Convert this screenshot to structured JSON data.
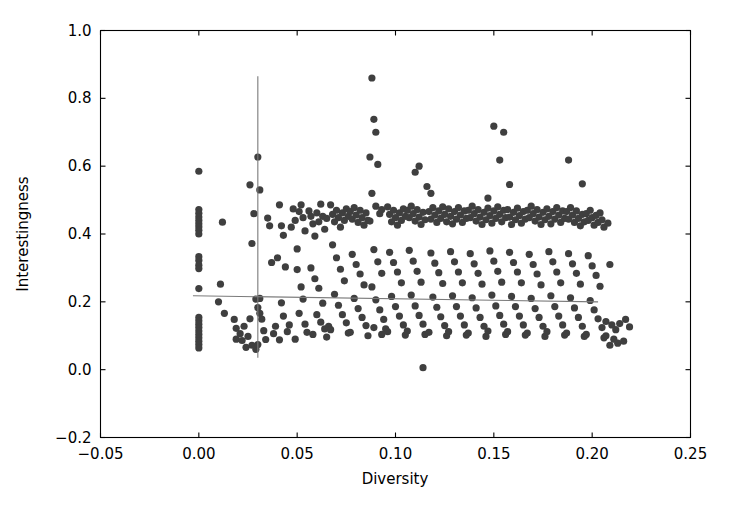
{
  "chart_data": {
    "type": "scatter",
    "title": "",
    "xlabel": "Diversity",
    "ylabel": "Interestingness",
    "xlim": [
      -0.05,
      0.25
    ],
    "ylim": [
      -0.2,
      1.0
    ],
    "xticks": [
      -0.05,
      0.0,
      0.05,
      0.1,
      0.15,
      0.2,
      0.25
    ],
    "xtick_labels": [
      "−0.05",
      "0.00",
      "0.05",
      "0.10",
      "0.15",
      "0.20",
      "0.25"
    ],
    "yticks": [
      -0.2,
      0.0,
      0.2,
      0.4,
      0.6,
      0.8,
      1.0
    ],
    "ytick_labels": [
      "−0.2",
      "0.0",
      "0.2",
      "0.4",
      "0.6",
      "0.8",
      "1.0"
    ],
    "grid": false,
    "legend": null,
    "marker": {
      "shape": "circle",
      "size": 5.2,
      "color": "#3f3f3f"
    },
    "annotations": [
      {
        "name": "vertical-reference-line",
        "type": "vline",
        "x": 0.03,
        "y_start": 0.035,
        "y_end": 0.865,
        "color": "#7a7a7a"
      },
      {
        "name": "regression-line",
        "type": "line",
        "x_start": -0.003,
        "x_end": 0.203,
        "y_start": 0.218,
        "y_end": 0.2,
        "color": "#7a7a7a"
      }
    ],
    "points": [
      [
        0.0,
        0.585
      ],
      [
        0.0,
        0.472
      ],
      [
        0.0,
        0.461
      ],
      [
        0.0,
        0.45
      ],
      [
        0.0,
        0.44
      ],
      [
        0.0,
        0.43
      ],
      [
        0.0,
        0.421
      ],
      [
        0.0,
        0.411
      ],
      [
        0.0,
        0.4
      ],
      [
        0.0,
        0.333
      ],
      [
        0.0,
        0.322
      ],
      [
        0.0,
        0.308
      ],
      [
        0.0,
        0.298
      ],
      [
        0.0,
        0.239
      ],
      [
        0.0,
        0.154
      ],
      [
        0.0,
        0.144
      ],
      [
        0.0,
        0.134
      ],
      [
        0.0,
        0.124
      ],
      [
        0.0,
        0.114
      ],
      [
        0.0,
        0.104
      ],
      [
        0.0,
        0.094
      ],
      [
        0.0,
        0.084
      ],
      [
        0.0,
        0.074
      ],
      [
        0.0,
        0.064
      ],
      [
        0.012,
        0.435
      ],
      [
        0.011,
        0.252
      ],
      [
        0.01,
        0.2
      ],
      [
        0.013,
        0.166
      ],
      [
        0.018,
        0.148
      ],
      [
        0.019,
        0.122
      ],
      [
        0.021,
        0.106
      ],
      [
        0.019,
        0.09
      ],
      [
        0.022,
        0.086
      ],
      [
        0.023,
        0.128
      ],
      [
        0.025,
        0.098
      ],
      [
        0.026,
        0.15
      ],
      [
        0.024,
        0.066
      ],
      [
        0.027,
        0.072
      ],
      [
        0.03,
        0.627
      ],
      [
        0.026,
        0.545
      ],
      [
        0.031,
        0.53
      ],
      [
        0.028,
        0.46
      ],
      [
        0.027,
        0.372
      ],
      [
        0.029,
        0.208
      ],
      [
        0.031,
        0.21
      ],
      [
        0.03,
        0.183
      ],
      [
        0.031,
        0.166
      ],
      [
        0.032,
        0.149
      ],
      [
        0.033,
        0.115
      ],
      [
        0.034,
        0.089
      ],
      [
        0.029,
        0.06
      ],
      [
        0.03,
        0.074
      ],
      [
        0.035,
        0.447
      ],
      [
        0.036,
        0.424
      ],
      [
        0.037,
        0.316
      ],
      [
        0.039,
        0.128
      ],
      [
        0.038,
        0.106
      ],
      [
        0.041,
        0.486
      ],
      [
        0.042,
        0.424
      ],
      [
        0.043,
        0.396
      ],
      [
        0.04,
        0.33
      ],
      [
        0.044,
        0.303
      ],
      [
        0.042,
        0.197
      ],
      [
        0.043,
        0.158
      ],
      [
        0.045,
        0.112
      ],
      [
        0.041,
        0.088
      ],
      [
        0.046,
        0.132
      ],
      [
        0.048,
        0.474
      ],
      [
        0.049,
        0.44
      ],
      [
        0.047,
        0.42
      ],
      [
        0.05,
        0.356
      ],
      [
        0.052,
        0.486
      ],
      [
        0.051,
        0.466
      ],
      [
        0.053,
        0.448
      ],
      [
        0.054,
        0.409
      ],
      [
        0.05,
        0.295
      ],
      [
        0.052,
        0.244
      ],
      [
        0.053,
        0.208
      ],
      [
        0.051,
        0.166
      ],
      [
        0.054,
        0.134
      ],
      [
        0.055,
        0.11
      ],
      [
        0.049,
        0.09
      ],
      [
        0.056,
        0.468
      ],
      [
        0.057,
        0.452
      ],
      [
        0.058,
        0.43
      ],
      [
        0.059,
        0.394
      ],
      [
        0.06,
        0.462
      ],
      [
        0.061,
        0.436
      ],
      [
        0.062,
        0.488
      ],
      [
        0.063,
        0.452
      ],
      [
        0.064,
        0.414
      ],
      [
        0.065,
        0.446
      ],
      [
        0.057,
        0.3
      ],
      [
        0.059,
        0.268
      ],
      [
        0.061,
        0.24
      ],
      [
        0.063,
        0.196
      ],
      [
        0.06,
        0.162
      ],
      [
        0.062,
        0.14
      ],
      [
        0.064,
        0.12
      ],
      [
        0.058,
        0.104
      ],
      [
        0.065,
        0.096
      ],
      [
        0.066,
        0.128
      ],
      [
        0.067,
        0.486
      ],
      [
        0.068,
        0.458
      ],
      [
        0.069,
        0.436
      ],
      [
        0.07,
        0.47
      ],
      [
        0.071,
        0.448
      ],
      [
        0.072,
        0.42
      ],
      [
        0.073,
        0.462
      ],
      [
        0.074,
        0.44
      ],
      [
        0.075,
        0.474
      ],
      [
        0.076,
        0.452
      ],
      [
        0.068,
        0.368
      ],
      [
        0.07,
        0.33
      ],
      [
        0.072,
        0.296
      ],
      [
        0.074,
        0.262
      ],
      [
        0.069,
        0.222
      ],
      [
        0.071,
        0.19
      ],
      [
        0.073,
        0.162
      ],
      [
        0.075,
        0.138
      ],
      [
        0.067,
        0.118
      ],
      [
        0.076,
        0.108
      ],
      [
        0.077,
        0.466
      ],
      [
        0.078,
        0.444
      ],
      [
        0.079,
        0.478
      ],
      [
        0.08,
        0.456
      ],
      [
        0.081,
        0.434
      ],
      [
        0.082,
        0.47
      ],
      [
        0.083,
        0.448
      ],
      [
        0.084,
        0.426
      ],
      [
        0.085,
        0.462
      ],
      [
        0.086,
        0.44
      ],
      [
        0.078,
        0.34
      ],
      [
        0.08,
        0.31
      ],
      [
        0.082,
        0.282
      ],
      [
        0.084,
        0.25
      ],
      [
        0.079,
        0.21
      ],
      [
        0.081,
        0.18
      ],
      [
        0.083,
        0.154
      ],
      [
        0.085,
        0.13
      ],
      [
        0.077,
        0.11
      ],
      [
        0.086,
        0.1
      ],
      [
        0.088,
        0.86
      ],
      [
        0.089,
        0.738
      ],
      [
        0.09,
        0.7
      ],
      [
        0.087,
        0.627
      ],
      [
        0.091,
        0.605
      ],
      [
        0.088,
        0.52
      ],
      [
        0.09,
        0.482
      ],
      [
        0.092,
        0.46
      ],
      [
        0.087,
        0.438
      ],
      [
        0.093,
        0.472
      ],
      [
        0.089,
        0.354
      ],
      [
        0.091,
        0.318
      ],
      [
        0.093,
        0.284
      ],
      [
        0.088,
        0.244
      ],
      [
        0.09,
        0.206
      ],
      [
        0.092,
        0.176
      ],
      [
        0.094,
        0.148
      ],
      [
        0.089,
        0.124
      ],
      [
        0.093,
        0.104
      ],
      [
        0.095,
        0.12
      ],
      [
        0.096,
        0.48
      ],
      [
        0.097,
        0.458
      ],
      [
        0.098,
        0.436
      ],
      [
        0.099,
        0.47
      ],
      [
        0.1,
        0.448
      ],
      [
        0.101,
        0.426
      ],
      [
        0.102,
        0.462
      ],
      [
        0.103,
        0.44
      ],
      [
        0.104,
        0.474
      ],
      [
        0.105,
        0.452
      ],
      [
        0.097,
        0.346
      ],
      [
        0.099,
        0.316
      ],
      [
        0.101,
        0.288
      ],
      [
        0.103,
        0.256
      ],
      [
        0.098,
        0.216
      ],
      [
        0.1,
        0.186
      ],
      [
        0.102,
        0.158
      ],
      [
        0.104,
        0.132
      ],
      [
        0.096,
        0.112
      ],
      [
        0.105,
        0.102
      ],
      [
        0.106,
        0.47
      ],
      [
        0.107,
        0.448
      ],
      [
        0.108,
        0.482
      ],
      [
        0.109,
        0.46
      ],
      [
        0.11,
        0.438
      ],
      [
        0.111,
        0.472
      ],
      [
        0.112,
        0.45
      ],
      [
        0.113,
        0.428
      ],
      [
        0.114,
        0.464
      ],
      [
        0.115,
        0.442
      ],
      [
        0.107,
        0.352
      ],
      [
        0.109,
        0.32
      ],
      [
        0.111,
        0.29
      ],
      [
        0.113,
        0.258
      ],
      [
        0.108,
        0.22
      ],
      [
        0.11,
        0.188
      ],
      [
        0.112,
        0.16
      ],
      [
        0.114,
        0.134
      ],
      [
        0.106,
        0.114
      ],
      [
        0.115,
        0.104
      ],
      [
        0.112,
        0.6
      ],
      [
        0.11,
        0.582
      ],
      [
        0.116,
        0.54
      ],
      [
        0.118,
        0.52
      ],
      [
        0.114,
        0.006
      ],
      [
        0.117,
        0.466
      ],
      [
        0.118,
        0.444
      ],
      [
        0.119,
        0.478
      ],
      [
        0.12,
        0.456
      ],
      [
        0.121,
        0.434
      ],
      [
        0.122,
        0.468
      ],
      [
        0.123,
        0.446
      ],
      [
        0.124,
        0.48
      ],
      [
        0.125,
        0.458
      ],
      [
        0.126,
        0.436
      ],
      [
        0.118,
        0.344
      ],
      [
        0.12,
        0.314
      ],
      [
        0.122,
        0.286
      ],
      [
        0.124,
        0.254
      ],
      [
        0.119,
        0.214
      ],
      [
        0.121,
        0.184
      ],
      [
        0.123,
        0.156
      ],
      [
        0.125,
        0.13
      ],
      [
        0.117,
        0.11
      ],
      [
        0.126,
        0.1
      ],
      [
        0.127,
        0.474
      ],
      [
        0.128,
        0.452
      ],
      [
        0.129,
        0.43
      ],
      [
        0.13,
        0.466
      ],
      [
        0.131,
        0.444
      ],
      [
        0.132,
        0.478
      ],
      [
        0.133,
        0.456
      ],
      [
        0.134,
        0.434
      ],
      [
        0.135,
        0.468
      ],
      [
        0.136,
        0.446
      ],
      [
        0.128,
        0.348
      ],
      [
        0.13,
        0.318
      ],
      [
        0.132,
        0.288
      ],
      [
        0.134,
        0.256
      ],
      [
        0.129,
        0.218
      ],
      [
        0.131,
        0.186
      ],
      [
        0.133,
        0.158
      ],
      [
        0.135,
        0.132
      ],
      [
        0.127,
        0.112
      ],
      [
        0.136,
        0.102
      ],
      [
        0.137,
        0.47
      ],
      [
        0.138,
        0.448
      ],
      [
        0.139,
        0.482
      ],
      [
        0.14,
        0.46
      ],
      [
        0.141,
        0.438
      ],
      [
        0.142,
        0.472
      ],
      [
        0.143,
        0.45
      ],
      [
        0.144,
        0.428
      ],
      [
        0.145,
        0.464
      ],
      [
        0.146,
        0.442
      ],
      [
        0.138,
        0.342
      ],
      [
        0.14,
        0.312
      ],
      [
        0.142,
        0.284
      ],
      [
        0.144,
        0.252
      ],
      [
        0.139,
        0.212
      ],
      [
        0.141,
        0.182
      ],
      [
        0.143,
        0.154
      ],
      [
        0.145,
        0.128
      ],
      [
        0.137,
        0.108
      ],
      [
        0.146,
        0.098
      ],
      [
        0.147,
        0.476
      ],
      [
        0.148,
        0.454
      ],
      [
        0.149,
        0.432
      ],
      [
        0.15,
        0.468
      ],
      [
        0.151,
        0.446
      ],
      [
        0.152,
        0.48
      ],
      [
        0.153,
        0.458
      ],
      [
        0.154,
        0.436
      ],
      [
        0.155,
        0.47
      ],
      [
        0.156,
        0.448
      ],
      [
        0.148,
        0.35
      ],
      [
        0.15,
        0.32
      ],
      [
        0.152,
        0.29
      ],
      [
        0.154,
        0.258
      ],
      [
        0.149,
        0.22
      ],
      [
        0.151,
        0.188
      ],
      [
        0.153,
        0.16
      ],
      [
        0.155,
        0.134
      ],
      [
        0.147,
        0.114
      ],
      [
        0.156,
        0.104
      ],
      [
        0.15,
        0.718
      ],
      [
        0.155,
        0.7
      ],
      [
        0.153,
        0.618
      ],
      [
        0.147,
        0.506
      ],
      [
        0.158,
        0.546
      ],
      [
        0.157,
        0.472
      ],
      [
        0.158,
        0.45
      ],
      [
        0.159,
        0.428
      ],
      [
        0.16,
        0.464
      ],
      [
        0.161,
        0.442
      ],
      [
        0.162,
        0.476
      ],
      [
        0.163,
        0.454
      ],
      [
        0.164,
        0.432
      ],
      [
        0.165,
        0.466
      ],
      [
        0.166,
        0.444
      ],
      [
        0.158,
        0.346
      ],
      [
        0.16,
        0.316
      ],
      [
        0.162,
        0.288
      ],
      [
        0.164,
        0.256
      ],
      [
        0.159,
        0.216
      ],
      [
        0.161,
        0.186
      ],
      [
        0.163,
        0.158
      ],
      [
        0.165,
        0.132
      ],
      [
        0.157,
        0.112
      ],
      [
        0.166,
        0.102
      ],
      [
        0.167,
        0.47
      ],
      [
        0.168,
        0.448
      ],
      [
        0.169,
        0.482
      ],
      [
        0.17,
        0.46
      ],
      [
        0.171,
        0.438
      ],
      [
        0.172,
        0.472
      ],
      [
        0.173,
        0.45
      ],
      [
        0.174,
        0.428
      ],
      [
        0.175,
        0.464
      ],
      [
        0.176,
        0.442
      ],
      [
        0.168,
        0.34
      ],
      [
        0.17,
        0.31
      ],
      [
        0.172,
        0.282
      ],
      [
        0.174,
        0.25
      ],
      [
        0.169,
        0.21
      ],
      [
        0.171,
        0.18
      ],
      [
        0.173,
        0.154
      ],
      [
        0.175,
        0.128
      ],
      [
        0.167,
        0.108
      ],
      [
        0.176,
        0.098
      ],
      [
        0.177,
        0.474
      ],
      [
        0.178,
        0.452
      ],
      [
        0.179,
        0.43
      ],
      [
        0.18,
        0.466
      ],
      [
        0.181,
        0.444
      ],
      [
        0.182,
        0.478
      ],
      [
        0.183,
        0.456
      ],
      [
        0.184,
        0.434
      ],
      [
        0.185,
        0.468
      ],
      [
        0.186,
        0.446
      ],
      [
        0.178,
        0.348
      ],
      [
        0.18,
        0.318
      ],
      [
        0.182,
        0.288
      ],
      [
        0.184,
        0.256
      ],
      [
        0.179,
        0.218
      ],
      [
        0.181,
        0.186
      ],
      [
        0.183,
        0.158
      ],
      [
        0.185,
        0.132
      ],
      [
        0.177,
        0.112
      ],
      [
        0.186,
        0.102
      ],
      [
        0.187,
        0.466
      ],
      [
        0.188,
        0.444
      ],
      [
        0.189,
        0.478
      ],
      [
        0.19,
        0.456
      ],
      [
        0.191,
        0.434
      ],
      [
        0.192,
        0.468
      ],
      [
        0.193,
        0.446
      ],
      [
        0.194,
        0.424
      ],
      [
        0.195,
        0.458
      ],
      [
        0.196,
        0.436
      ],
      [
        0.188,
        0.342
      ],
      [
        0.19,
        0.312
      ],
      [
        0.192,
        0.284
      ],
      [
        0.194,
        0.252
      ],
      [
        0.189,
        0.212
      ],
      [
        0.191,
        0.182
      ],
      [
        0.193,
        0.154
      ],
      [
        0.195,
        0.128
      ],
      [
        0.187,
        0.108
      ],
      [
        0.196,
        0.098
      ],
      [
        0.197,
        0.46
      ],
      [
        0.198,
        0.44
      ],
      [
        0.199,
        0.47
      ],
      [
        0.2,
        0.448
      ],
      [
        0.201,
        0.426
      ],
      [
        0.202,
        0.455
      ],
      [
        0.203,
        0.434
      ],
      [
        0.204,
        0.462
      ],
      [
        0.205,
        0.442
      ],
      [
        0.206,
        0.42
      ],
      [
        0.198,
        0.336
      ],
      [
        0.2,
        0.306
      ],
      [
        0.202,
        0.278
      ],
      [
        0.204,
        0.246
      ],
      [
        0.199,
        0.204
      ],
      [
        0.201,
        0.176
      ],
      [
        0.203,
        0.15
      ],
      [
        0.205,
        0.124
      ],
      [
        0.197,
        0.104
      ],
      [
        0.206,
        0.094
      ],
      [
        0.188,
        0.618
      ],
      [
        0.195,
        0.548
      ],
      [
        0.208,
        0.432
      ],
      [
        0.209,
        0.31
      ],
      [
        0.207,
        0.142
      ],
      [
        0.21,
        0.132
      ],
      [
        0.212,
        0.118
      ],
      [
        0.214,
        0.136
      ],
      [
        0.217,
        0.148
      ],
      [
        0.219,
        0.126
      ],
      [
        0.207,
        0.1
      ],
      [
        0.211,
        0.09
      ],
      [
        0.213,
        0.078
      ],
      [
        0.209,
        0.072
      ],
      [
        0.216,
        0.084
      ]
    ]
  },
  "axes": {
    "xlabel": "Diversity",
    "ylabel": "Interestingness"
  }
}
